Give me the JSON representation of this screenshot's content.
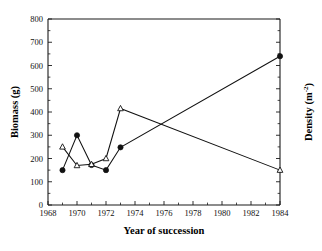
{
  "chart_data": {
    "type": "line",
    "title": "",
    "xlabel": "Year of succession",
    "ylabel": "Biomass (g)",
    "ylabel_right": "Density (m",
    "ylabel_right_sup": "-2",
    "ylabel_right_close": ")",
    "xlim": [
      1968,
      1984
    ],
    "ylim": [
      0,
      800
    ],
    "xticks": [
      1968,
      1970,
      1972,
      1974,
      1976,
      1978,
      1980,
      1982,
      1984
    ],
    "xtick_labels": [
      "1968",
      "1970",
      "1972",
      "1974",
      "1976",
      "1978",
      "1980",
      "1982",
      "1984"
    ],
    "xticks_minor": [
      1969,
      1971,
      1973,
      1975,
      1977,
      1979,
      1981,
      1983
    ],
    "yticks": [
      0,
      100,
      200,
      300,
      400,
      500,
      600,
      700,
      800
    ],
    "ytick_labels": [
      "0",
      "100",
      "200",
      "300",
      "400",
      "500",
      "600",
      "700",
      "800"
    ],
    "grid": false,
    "legend": "none",
    "series": [
      {
        "name": "Biomass",
        "marker": "filled-circle",
        "x": [
          1969,
          1970,
          1971,
          1972,
          1973,
          1984
        ],
        "values": [
          150,
          300,
          172,
          150,
          248,
          640
        ]
      },
      {
        "name": "Density",
        "marker": "open-triangle",
        "x": [
          1969,
          1970,
          1971,
          1972,
          1973,
          1984
        ],
        "values": [
          250,
          170,
          175,
          200,
          415,
          150
        ]
      }
    ]
  }
}
